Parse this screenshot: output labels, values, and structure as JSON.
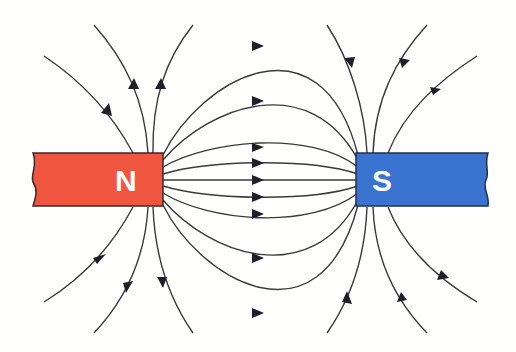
{
  "diagram": {
    "magnets": [
      {
        "id": "north",
        "label": "N",
        "color": "#f0553f",
        "edge": "#3b2a2a",
        "x": 33,
        "y": 153,
        "w": 130,
        "h": 53
      },
      {
        "id": "south",
        "label": "S",
        "color": "#3a72d0",
        "edge": "#22304a",
        "x": 356,
        "y": 153,
        "w": 132,
        "h": 53
      }
    ],
    "line_color": "#3a3a3a",
    "arrow_color": "#1f1f2a",
    "field_direction": "from N to S"
  }
}
